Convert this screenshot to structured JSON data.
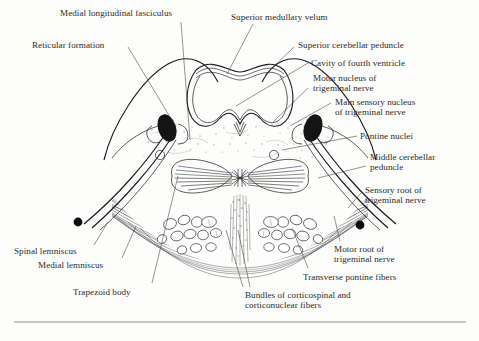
{
  "figure": {
    "background_color": "#fdfdfb",
    "ink_color": "#1d1d1f",
    "label_color": "#2b2b2e"
  },
  "labels": [
    {
      "id": "medial-longitudinal-fasciculus",
      "text": "Medial longitudinal fasciculus",
      "x": 60,
      "y": 8,
      "align": "left"
    },
    {
      "id": "superior-medullary-velum",
      "text": "Superior medullary velum",
      "x": 231,
      "y": 12,
      "align": "left"
    },
    {
      "id": "reticular-formation",
      "text": "Reticular formation",
      "x": 32,
      "y": 40,
      "align": "left"
    },
    {
      "id": "superior-cerebellar-peduncle",
      "text": "Superior cerebellar peduncle",
      "x": 298,
      "y": 40,
      "align": "left"
    },
    {
      "id": "cavity-of-fourth-ventricle",
      "text": "Cavity of fourth ventricle",
      "x": 311,
      "y": 58,
      "align": "left"
    },
    {
      "id": "motor-nucleus-of-trigeminal-nerve",
      "text": "Motor nucleus of\ntrigeminal nerve",
      "x": 313,
      "y": 73,
      "align": "left"
    },
    {
      "id": "main-sensory-nucleus-of-trigeminal-nerve",
      "text": "Main sensory nucleus\nof trigeminal nerve",
      "x": 335,
      "y": 97,
      "align": "left"
    },
    {
      "id": "pontine-nuclei",
      "text": "Pontine nuclei",
      "x": 360,
      "y": 131,
      "align": "left"
    },
    {
      "id": "middle-cerebellar-peduncle",
      "text": "Middle cerebellar\npeduncle",
      "x": 370,
      "y": 152,
      "align": "left"
    },
    {
      "id": "sensory-root-of-trigeminal-nerve",
      "text": "Sensory root of\ntrigeminal nerve",
      "x": 365,
      "y": 185,
      "align": "left"
    },
    {
      "id": "motor-root-of-trigeminal-nerve",
      "text": "Motor root of\ntrigeminal nerve",
      "x": 334,
      "y": 244,
      "align": "left"
    },
    {
      "id": "transverse-pontine-fibers",
      "text": "Transverse pontine fibers",
      "x": 303,
      "y": 272,
      "align": "left"
    },
    {
      "id": "spinal-lemniscus",
      "text": "Spinal lemniscus",
      "x": 14,
      "y": 246,
      "align": "left"
    },
    {
      "id": "medial-lemniscus",
      "text": "Medial lemniscus",
      "x": 38,
      "y": 260,
      "align": "left"
    },
    {
      "id": "trapezoid-body",
      "text": "Trapezoid body",
      "x": 73,
      "y": 287,
      "align": "left"
    },
    {
      "id": "bundles-of-corticospinal-and-corticonuclear-fibers",
      "text": "Bundles of corticospinal and\ncorticonuclear fibers",
      "x": 245,
      "y": 290,
      "align": "left"
    }
  ],
  "leader_lines": [
    {
      "id": "leader-medial-longitudinal-fasciculus",
      "path": "M 181 22 L 190 140"
    },
    {
      "id": "leader-superior-medullary-velum",
      "path": "M 253 24 L 227 74"
    },
    {
      "id": "leader-reticular-formation",
      "path": "M 128 47 L 176 127"
    },
    {
      "id": "leader-superior-cerebellar-peduncle",
      "path": "M 294 47 L 265 75"
    },
    {
      "id": "leader-cavity-of-fourth-ventricle",
      "path": "M 308 63 L 236 106"
    },
    {
      "id": "leader-motor-nucleus",
      "path": "M 308 88 L 273 122"
    },
    {
      "id": "leader-main-sensory-nucleus",
      "path": "M 331 103 L 290 126"
    },
    {
      "id": "leader-pontine-nuclei",
      "path": "M 357 136 L 282 150"
    },
    {
      "id": "leader-middle-cerebellar-peduncle",
      "path": "M 366 166 L 318 178"
    },
    {
      "id": "leader-sensory-root",
      "path": "M 362 192 L 348 208"
    },
    {
      "id": "leader-motor-root",
      "path": "M 340 241 L 334 216"
    },
    {
      "id": "leader-transverse-pontine-fibers",
      "path": "M 308 268 L 292 228"
    },
    {
      "id": "leader-spinal-lemniscus",
      "path": "M 94 245 L 108 222"
    },
    {
      "id": "leader-medial-lemniscus",
      "path": "M 122 258 L 136 226"
    },
    {
      "id": "leader-trapezoid-body",
      "path": "M 152 283 L 178 176"
    },
    {
      "id": "leader-bundles-a",
      "path": "M 243 287 L 226 230"
    },
    {
      "id": "leader-bundles-b",
      "path": "M 250 287 L 238 230"
    }
  ],
  "structures": {
    "brainstem_outline": "outer silhouette of pons with cerebellar peduncles",
    "fourth_ventricle": "open cavity at dorsal midline",
    "trigeminal_nuclei": "two dark oval nuclei, left and right",
    "medial_lemniscus_band": "butterfly-shaped band with fine striations",
    "corticospinal_bundles": "oval white bundles in basilar pons",
    "nerve_root_dots": "two solid black dots at the trigeminal nerve roots",
    "open_circles": "two small open circles lateral to midline"
  },
  "bottom_rule": {
    "id": "page-rule",
    "y": 322
  }
}
